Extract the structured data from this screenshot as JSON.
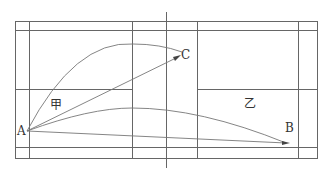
{
  "diagram": {
    "points": {
      "A": {
        "label": "A"
      },
      "B": {
        "label": "B"
      },
      "C": {
        "label": "C"
      }
    },
    "regions": {
      "jia": {
        "label": "甲"
      },
      "yi": {
        "label": "乙"
      }
    },
    "colors": {
      "lines": "#555555",
      "curves": "#777777",
      "background": "#ffffff"
    }
  }
}
